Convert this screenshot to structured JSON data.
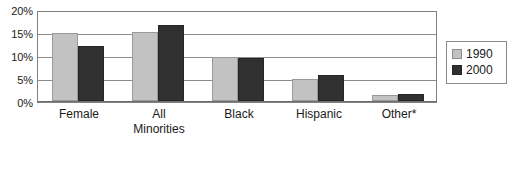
{
  "chart_data": {
    "type": "bar",
    "title": "",
    "subtitle": "",
    "xlabel": "",
    "ylabel": "",
    "ylim": [
      0,
      20
    ],
    "y_unit": "%",
    "grid": true,
    "legend_position": "right",
    "categories": [
      "Female",
      "All Minorities",
      "Black",
      "Hispanic",
      "Other*"
    ],
    "category_labels": [
      {
        "line1": "Female",
        "line2": ""
      },
      {
        "line1": "All",
        "line2": "Minorities"
      },
      {
        "line1": "Black",
        "line2": ""
      },
      {
        "line1": "Hispanic",
        "line2": ""
      },
      {
        "line1": "Other*",
        "line2": ""
      }
    ],
    "y_ticks": [
      {
        "value": 20,
        "label": "20%"
      },
      {
        "value": 15,
        "label": "15%"
      },
      {
        "value": 10,
        "label": "10%"
      },
      {
        "value": 5,
        "label": "5%"
      },
      {
        "value": 0,
        "label": "0%"
      }
    ],
    "series": [
      {
        "name": "1990",
        "color": "#c2c2c2",
        "values": [
          15.5,
          15.7,
          10.0,
          5.1,
          1.4
        ]
      },
      {
        "name": "2000",
        "color": "#303030",
        "values": [
          12.5,
          17.3,
          9.8,
          5.9,
          1.7
        ]
      }
    ]
  },
  "legend": {
    "items": [
      {
        "label": "1990",
        "swatch": "legend-swatch-1990"
      },
      {
        "label": "2000",
        "swatch": "legend-swatch-2000"
      }
    ]
  },
  "colors": {
    "series_1990": "#c2c2c2",
    "series_2000": "#303030",
    "gridline": "#8c8c8c",
    "axis": "#808080",
    "text": "#1a1a1a",
    "background": "#ffffff"
  }
}
